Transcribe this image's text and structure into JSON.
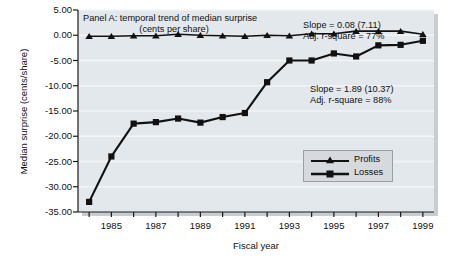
{
  "chart_data": {
    "type": "line",
    "title": "Panel A: temporal trend of median surprise",
    "subtitle": "(cents per share)",
    "xlabel": "Fiscal year",
    "ylabel": "Median surprise (cents/share)",
    "xlim": [
      1983.5,
      1999.5
    ],
    "ylim": [
      -35.0,
      5.0
    ],
    "grid": true,
    "legend_position": "center-right",
    "x": [
      1984,
      1985,
      1986,
      1987,
      1988,
      1989,
      1990,
      1991,
      1992,
      1993,
      1994,
      1995,
      1996,
      1997,
      1998,
      1999
    ],
    "xtick_labels": [
      "1985",
      "1987",
      "1989",
      "1991",
      "1993",
      "1995",
      "1997",
      "1999"
    ],
    "xtick_values": [
      1985,
      1987,
      1989,
      1991,
      1993,
      1995,
      1997,
      1999
    ],
    "ytick_labels": [
      "5.00",
      "0.00",
      "-5.00",
      "-10.00",
      "-15.00",
      "-20.00",
      "-25.00",
      "-30.00",
      "-35.00"
    ],
    "ytick_values": [
      5,
      0,
      -5,
      -10,
      -15,
      -20,
      -25,
      -30,
      -35
    ],
    "series": [
      {
        "name": "Profits",
        "marker": "triangle",
        "color": "#111111",
        "values": [
          -0.2,
          -0.2,
          -0.1,
          -0.1,
          0.2,
          0.0,
          -0.1,
          -0.2,
          0.0,
          -0.1,
          0.3,
          0.3,
          0.8,
          0.8,
          0.8,
          0.2
        ]
      },
      {
        "name": "Losses",
        "marker": "square",
        "color": "#111111",
        "values": [
          -33.0,
          -24.0,
          -17.5,
          -17.2,
          -16.5,
          -17.3,
          -16.2,
          -15.4,
          -9.3,
          -5.0,
          -5.0,
          -3.6,
          -4.2,
          -2.0,
          -1.9,
          -1.1
        ]
      }
    ],
    "annotations": [
      {
        "id": "profits-fit",
        "line1": "Slope = 0.08 (7.11)",
        "line2": "Adj. r-square = 77%"
      },
      {
        "id": "losses-fit",
        "line1": "Slope = 1.89 (10.37)",
        "line2": "Adj. r-square = 88%"
      }
    ],
    "legend_entries": [
      {
        "label": "Profits",
        "marker": "triangle"
      },
      {
        "label": "Losses",
        "marker": "square"
      }
    ]
  }
}
